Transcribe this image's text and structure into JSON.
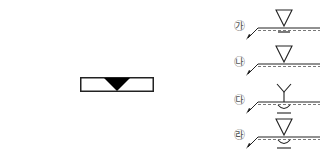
{
  "figure": {
    "main_drawing": {
      "description": "Rectangular plate section with a filled V-groove weld at top center",
      "fill_color": "#000000"
    },
    "options": [
      {
        "label": "㉮",
        "symbol": "V-groove weld, arrow side; no backing",
        "top": 8
      },
      {
        "label": "㉯",
        "symbol": "V-groove weld, arrow side; no backing",
        "top": 44
      },
      {
        "label": "㉰",
        "symbol": "Y-groove with back-bead/backing weld underneath",
        "top": 82
      },
      {
        "label": "㉱",
        "symbol": "V-groove with back-bead/backing weld underneath",
        "top": 117
      }
    ]
  }
}
